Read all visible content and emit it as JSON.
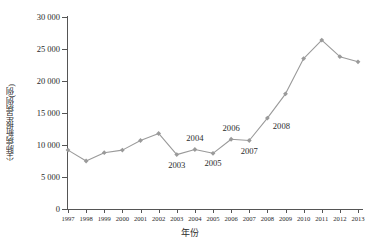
{
  "chart_data": {
    "type": "line",
    "title": "",
    "xlabel": "年份",
    "ylabel": "尘肺病新报告病例(例)",
    "x": [
      1997,
      1998,
      1999,
      2000,
      2001,
      2002,
      2003,
      2004,
      2005,
      2006,
      2007,
      2008,
      2009,
      2010,
      2011,
      2012,
      2013
    ],
    "categories": [
      "1997",
      "1998",
      "1999",
      "2000",
      "2001",
      "2002",
      "2003",
      "2004",
      "2005",
      "2006",
      "2007",
      "2008",
      "2009",
      "2010",
      "2011",
      "2012",
      "2013"
    ],
    "values": [
      9200,
      7500,
      8800,
      9200,
      10700,
      11800,
      8500,
      9300,
      8700,
      10900,
      10700,
      14200,
      18000,
      23500,
      26400,
      23800,
      23000
    ],
    "series": [
      {
        "name": "尘肺病新报告病例",
        "values": [
          9200,
          7500,
          8800,
          9200,
          10700,
          11800,
          8500,
          9300,
          8700,
          10900,
          10700,
          14200,
          18000,
          23500,
          26400,
          23800,
          23000
        ]
      }
    ],
    "ylim": [
      0,
      30000
    ],
    "xlim": [
      1997,
      2013
    ],
    "yticks": [
      0,
      5000,
      10000,
      15000,
      20000,
      25000,
      30000
    ],
    "ytick_labels": [
      "0",
      "5 000",
      "10 000",
      "15 000",
      "20 000",
      "25 000",
      "30 000"
    ],
    "grid": false,
    "legend": null,
    "line_color": "#9a9a9a",
    "marker_color": "#9a9a9a",
    "marker": "diamond",
    "annotations": [
      {
        "text": "2003",
        "x": 2003,
        "y": 8500,
        "position": "below"
      },
      {
        "text": "2004",
        "x": 2004,
        "y": 9300,
        "position": "above"
      },
      {
        "text": "2005",
        "x": 2005,
        "y": 8700,
        "position": "below"
      },
      {
        "text": "2006",
        "x": 2006,
        "y": 10900,
        "position": "above"
      },
      {
        "text": "2007",
        "x": 2007,
        "y": 10700,
        "position": "below"
      },
      {
        "text": "2008",
        "x": 2008,
        "y": 14200,
        "position": "below-right"
      }
    ]
  },
  "axis": {
    "x_title": "年份",
    "y_title": "尘肺病新报告病例(例)"
  },
  "colors": {
    "line": "#9a9a9a",
    "axis": "#555555",
    "text": "#2b2b2b",
    "background": "#ffffff"
  }
}
